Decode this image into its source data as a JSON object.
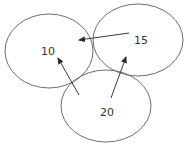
{
  "diagram": {
    "type": "graph",
    "colors": {
      "node_stroke": "#6e6e6e",
      "edge": "#3a3a3a",
      "text": "#333333",
      "background": "#ffffff"
    },
    "nodes": [
      {
        "id": "n10",
        "label": "10",
        "cx": 49,
        "cy": 51,
        "rx": 44,
        "ry": 37,
        "label_x": 48,
        "label_y": 55
      },
      {
        "id": "n15",
        "label": "15",
        "cx": 138,
        "cy": 40,
        "rx": 45,
        "ry": 36,
        "label_x": 141,
        "label_y": 44
      },
      {
        "id": "n20",
        "label": "20",
        "cx": 106,
        "cy": 106,
        "rx": 45,
        "ry": 36,
        "label_x": 107,
        "label_y": 116
      }
    ],
    "edges": [
      {
        "from": "n15",
        "to": "n10",
        "x1": 129,
        "y1": 33,
        "x2": 79,
        "y2": 40
      },
      {
        "from": "n20",
        "to": "n10",
        "x1": 79,
        "y1": 95,
        "x2": 58,
        "y2": 58
      },
      {
        "from": "n20",
        "to": "n15",
        "x1": 111,
        "y1": 98,
        "x2": 126,
        "y2": 57
      }
    ]
  }
}
